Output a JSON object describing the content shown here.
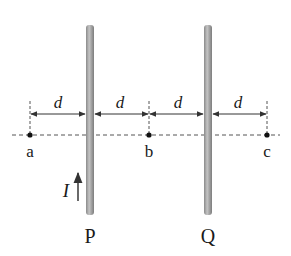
{
  "diagram": {
    "wires": [
      {
        "id": "P",
        "label": "P"
      },
      {
        "id": "Q",
        "label": "Q"
      }
    ],
    "points": [
      {
        "id": "a",
        "label": "a"
      },
      {
        "id": "b",
        "label": "b"
      },
      {
        "id": "c",
        "label": "c"
      }
    ],
    "spacing_labels": [
      "d",
      "d",
      "d",
      "d"
    ],
    "current": {
      "label": "I",
      "direction": "up",
      "wire": "P"
    },
    "colors": {
      "wire": "#9a9a9a",
      "wire_highlight": "#c8c8c8",
      "line": "#333333",
      "dashed": "#555555",
      "text": "#1a1a1a"
    }
  }
}
